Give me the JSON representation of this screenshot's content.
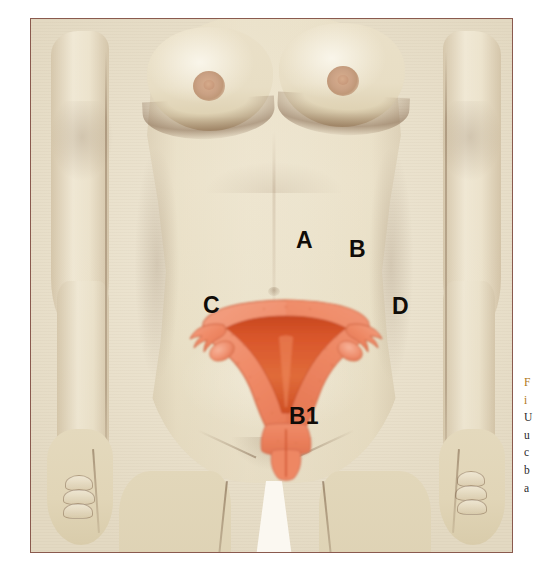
{
  "figure": {
    "kind": "anatomical-illustration",
    "frame_border_color": "#8a5a4e",
    "background_color": "#efe7d4",
    "skin_color": "#e6dbc0",
    "skin_shadow_color": "#b99a74",
    "leg_gap_color": "#fbf8f1"
  },
  "organ": {
    "name": "uterus-with-fallopian-tubes-and-ovaries",
    "outer_color": "#f0906d",
    "outer_color_dark": "#e2714c",
    "cavity_color": "#d9562b",
    "cavity_color_dark": "#c2451f",
    "outline_color": "#c85a33",
    "parts": [
      "fundus",
      "uterine-body",
      "endometrial-cavity",
      "left-fallopian-tube",
      "right-fallopian-tube",
      "left-fimbriae",
      "right-fimbriae",
      "left-ovary",
      "right-ovary",
      "cervix",
      "vagina"
    ]
  },
  "labels": [
    {
      "id": "A",
      "text": "A",
      "x": 272,
      "y": 222
    },
    {
      "id": "B",
      "text": "B",
      "x": 325,
      "y": 231
    },
    {
      "id": "C",
      "text": "C",
      "x": 179,
      "y": 287
    },
    {
      "id": "D",
      "text": "D",
      "x": 368,
      "y": 288
    },
    {
      "id": "B1",
      "text": "B1",
      "x": 272,
      "y": 398
    }
  ],
  "caption": {
    "clipped": true,
    "note": "caption text runs off the right edge of the screenshot; only the first characters of each line are visible",
    "lines": [
      {
        "text": "F",
        "accent": true
      },
      {
        "text": "i",
        "accent": true
      },
      {
        "text": "U",
        "accent": false
      },
      {
        "text": "u",
        "accent": false
      },
      {
        "text": "c",
        "accent": false
      },
      {
        "text": "b",
        "accent": false
      },
      {
        "text": "a",
        "accent": false
      }
    ]
  }
}
